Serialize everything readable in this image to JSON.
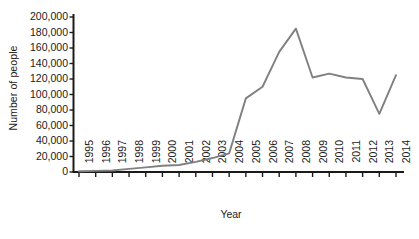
{
  "chart_data": {
    "type": "line",
    "title": "",
    "xlabel": "Year",
    "ylabel": "Number of people",
    "categories": [
      "1995",
      "1996",
      "1997",
      "1998",
      "1999",
      "2000",
      "2001",
      "2002",
      "2003",
      "2004",
      "2005",
      "2006",
      "2007",
      "2008",
      "2009",
      "2010",
      "2011",
      "2012",
      "2013",
      "2014"
    ],
    "x": [
      1995,
      1996,
      1997,
      1998,
      1999,
      2000,
      2001,
      2002,
      2003,
      2004,
      2005,
      2006,
      2007,
      2008,
      2009,
      2010,
      2011,
      2012,
      2013,
      2014
    ],
    "values": [
      1000,
      1500,
      2000,
      4000,
      6000,
      8000,
      9000,
      13000,
      18000,
      24000,
      95000,
      110000,
      155000,
      185000,
      122000,
      127000,
      122000,
      120000,
      75000,
      125000
    ],
    "series": [
      {
        "name": "Number of people",
        "values": [
          1000,
          1500,
          2000,
          4000,
          6000,
          8000,
          9000,
          13000,
          18000,
          24000,
          95000,
          110000,
          155000,
          185000,
          122000,
          127000,
          122000,
          120000,
          75000,
          125000
        ]
      }
    ],
    "ylim": [
      0,
      200000
    ],
    "xlim": [
      1995,
      2014
    ],
    "ytick_labels": [
      "200,000",
      "180,000",
      "160,000",
      "140,000",
      "120,000",
      "100,000",
      "80,000",
      "60,000",
      "40,000",
      "20,000",
      "0"
    ],
    "ytick_values": [
      200000,
      180000,
      160000,
      140000,
      120000,
      100000,
      80000,
      60000,
      40000,
      20000,
      0
    ],
    "grid": false,
    "legend": false,
    "legend_position": "none",
    "line_color": "#808080",
    "axis_color": "#1a1a1a",
    "text_color": "#1a1a1a"
  }
}
